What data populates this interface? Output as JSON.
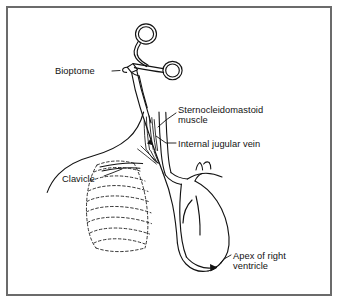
{
  "figure": {
    "type": "medical-line-illustration",
    "border_color": "#6b6b6b",
    "line_color": "#121212",
    "background_color": "#ffffff"
  },
  "labels": {
    "bioptome": "Bioptome",
    "sternocleidomastoid_line1": "Sternocleidomastoid",
    "sternocleidomastoid_line2": "muscle",
    "internal_jugular_vein": "Internal jugular vein",
    "clavicle": "Clavicle",
    "apex_line1": "Apex of right",
    "apex_line2": "ventricle"
  },
  "structures": [
    {
      "name": "bioptome-instrument",
      "description": "Scissor-style forceps with two finger rings and a long flexible shaft"
    },
    {
      "name": "sternocleidomastoid-muscle",
      "description": "Neck muscle fibers drawn as fine near-vertical strokes"
    },
    {
      "name": "internal-jugular-vein",
      "description": "Vein descending the neck into the subclavian junction"
    },
    {
      "name": "clavicle",
      "description": "Collarbone contour sweeping from the left shoulder"
    },
    {
      "name": "rib-cage",
      "description": "Ribs rendered as dashed arcs beneath the soft tissue"
    },
    {
      "name": "heart",
      "description": "Cardiac silhouette with great vessels"
    },
    {
      "name": "right-ventricle-apex",
      "description": "Catheter tip resting at the apex of the right ventricle"
    }
  ]
}
